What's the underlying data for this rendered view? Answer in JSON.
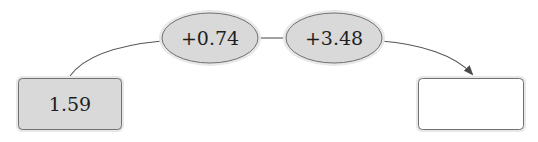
{
  "diagram": {
    "type": "number-line-operations",
    "start_box": {
      "value": "1.59"
    },
    "operations": [
      {
        "label": "+0.74"
      },
      {
        "label": "+3.48"
      }
    ],
    "result_box": {
      "value": ""
    }
  },
  "colors": {
    "node_fill": "#dcdcdc",
    "node_halo": "#e6e6e6",
    "node_border": "#6e6e6e",
    "edge": "#555555",
    "result_fill": "#ffffff"
  }
}
